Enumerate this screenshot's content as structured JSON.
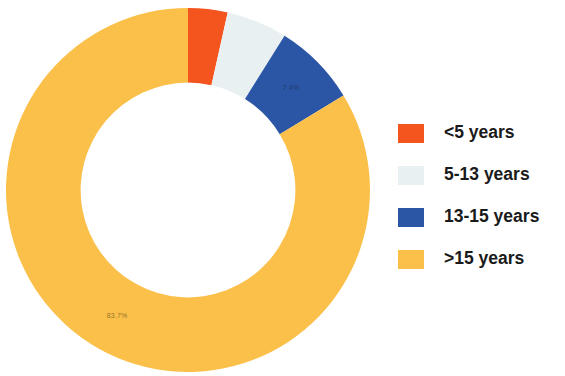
{
  "chart_data": {
    "type": "pie",
    "variant": "donut",
    "title": "",
    "subtitle": "",
    "xlabel": "",
    "ylabel": "",
    "grid": false,
    "legend_position": "right",
    "start_angle_deg": 0,
    "direction": "clockwise",
    "inner_radius_ratio": 0.59,
    "categories": [
      "<5 years",
      "5-13 years",
      "13-15 years",
      ">15 years"
    ],
    "values": [
      3.5,
      5.4,
      7.4,
      83.7
    ],
    "units": "%",
    "colors": [
      "#F4541E",
      "#E9F0F2",
      "#2B56A5",
      "#FBC04A"
    ],
    "slices": [
      {
        "label": "<5 years",
        "value": 3.5,
        "color": "#F4541E",
        "data_label": "",
        "data_label_visible": false
      },
      {
        "label": "5-13 years",
        "value": 5.4,
        "color": "#E9F0F2",
        "data_label": "",
        "data_label_visible": false
      },
      {
        "label": "13-15 years",
        "value": 7.4,
        "color": "#2B56A5",
        "data_label": "7.4%",
        "data_label_visible": true
      },
      {
        "label": ">15 years",
        "value": 83.7,
        "color": "#FBC04A",
        "data_label": "83.7%",
        "data_label_visible": true
      }
    ],
    "annotations": [
      "7.4%",
      "83.7%"
    ]
  },
  "legend": {
    "items": [
      {
        "label": "<5 years",
        "color": "#F4541E"
      },
      {
        "label": "5-13 years",
        "color": "#E9F0F2"
      },
      {
        "label": "13-15 years",
        "color": "#2B56A5"
      },
      {
        "label": ">15 years",
        "color": "#FBC04A"
      }
    ]
  },
  "labels": {
    "blue_slice": "7.4%",
    "yellow_slice": "83.7%"
  },
  "canvas": {
    "background": "#FFFFFF"
  }
}
